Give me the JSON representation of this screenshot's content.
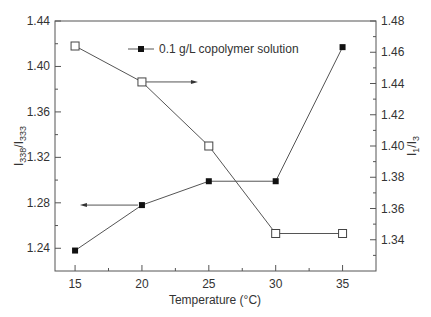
{
  "chart_data": {
    "type": "line",
    "title": "",
    "xlabel": "Temperature (°C)",
    "ylabel_left": "I338/I333",
    "ylabel_right": "I1/I3",
    "x": [
      15,
      20,
      25,
      30,
      35
    ],
    "xlim": [
      13.5,
      37.5
    ],
    "xticks": [
      "15",
      "20",
      "25",
      "30",
      "35"
    ],
    "ylim_left": [
      1.22,
      1.44
    ],
    "yticks_left": [
      "1.24",
      "1.28",
      "1.32",
      "1.36",
      "1.40",
      "1.44"
    ],
    "ylim_right": [
      1.32,
      1.48
    ],
    "yticks_right": [
      "1.34",
      "1.36",
      "1.38",
      "1.40",
      "1.42",
      "1.44",
      "1.46",
      "1.48"
    ],
    "grid": false,
    "legend_position": "upper center",
    "series": [
      {
        "name": "I338/I333",
        "axis": "left",
        "marker": "filled-square",
        "values": [
          1.238,
          1.278,
          1.299,
          1.299,
          1.417
        ]
      },
      {
        "name": "I1/I3",
        "axis": "right",
        "marker": "open-square",
        "values": [
          1.464,
          1.441,
          1.4,
          1.344,
          1.344
        ]
      }
    ],
    "legend": [
      {
        "label": "0.1 g/L copolymer solution",
        "marker": "filled-square"
      }
    ],
    "annotations": [
      {
        "type": "arrow",
        "direction": "left",
        "from_series": "I338/I333",
        "at_x": 20,
        "meaning": "points to left axis"
      },
      {
        "type": "arrow",
        "direction": "right",
        "from_series": "I1/I3",
        "at_x": 20,
        "meaning": "points to right axis"
      }
    ]
  },
  "colors": {
    "line": "#555555",
    "axis": "#555555",
    "marker_fill": "#111111",
    "text": "#333333"
  }
}
